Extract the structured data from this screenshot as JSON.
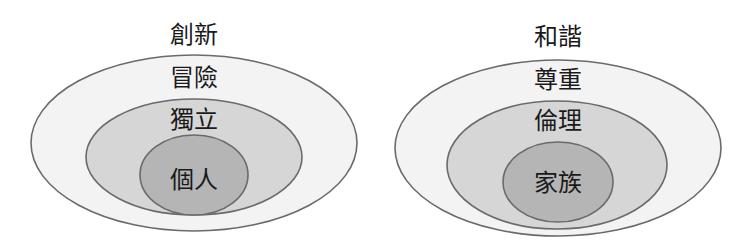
{
  "diagrams": [
    {
      "title": "創新",
      "layers": [
        {
          "level": "outer",
          "label": "冒險"
        },
        {
          "level": "middle",
          "label": "獨立"
        },
        {
          "level": "inner",
          "label": "個人"
        }
      ]
    },
    {
      "title": "和諧",
      "layers": [
        {
          "level": "outer",
          "label": "尊重"
        },
        {
          "level": "middle",
          "label": "倫理"
        },
        {
          "level": "inner",
          "label": "家族"
        }
      ]
    }
  ],
  "colors": {
    "outer_fill": "#f3f3f3",
    "middle_fill": "#d6d6d6",
    "inner_fill": "#b5b5b5",
    "stroke": "#6a6a6a",
    "text": "#1a1a1a"
  }
}
